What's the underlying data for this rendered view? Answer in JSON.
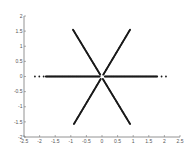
{
  "chart_data": {
    "type": "scatter",
    "title": "",
    "xlabel": "",
    "ylabel": "",
    "xlim": [
      -2.5,
      2.5
    ],
    "ylim": [
      -2,
      2
    ],
    "grid": false,
    "legend": null,
    "x_ticks": [
      "-2.5",
      "-2",
      "-1.5",
      "-1",
      "-0.5",
      "0",
      "0.5",
      "1",
      "1.5",
      "2",
      "2.5"
    ],
    "y_ticks": [
      "2",
      "1.5",
      "1",
      "0.5",
      "0",
      "-0.5",
      "-1",
      "-1.5",
      "-2"
    ],
    "marker_color": "#1a1a1a",
    "series": [
      {
        "name": "arm-horizontal",
        "from": [
          -2.15,
          0.0
        ],
        "to": [
          2.05,
          0.0
        ],
        "dense_range": [
          -1.8,
          1.76
        ]
      },
      {
        "name": "arm-diag-pos",
        "from": [
          -0.9,
          -1.57
        ],
        "to": [
          0.9,
          1.55
        ]
      },
      {
        "name": "arm-diag-neg",
        "from": [
          -0.93,
          1.55
        ],
        "to": [
          0.9,
          -1.57
        ]
      }
    ]
  }
}
